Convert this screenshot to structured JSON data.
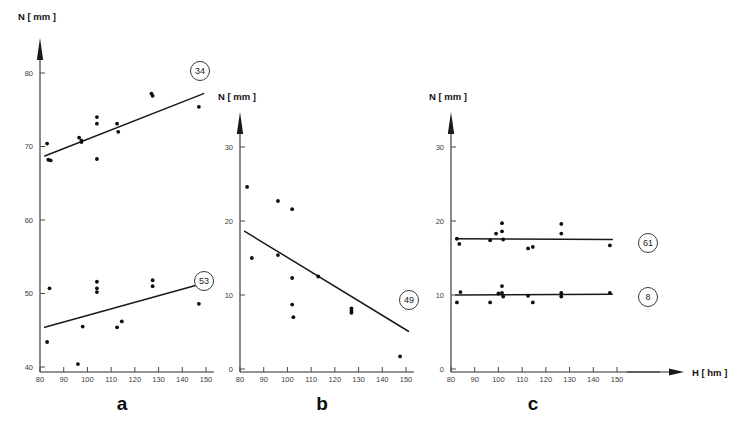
{
  "figure": {
    "panels": [
      {
        "letter": "a",
        "y_axis_title": "N [ mm ]",
        "x_axis_title": "",
        "y_ticks": [
          40,
          50,
          60,
          70,
          80
        ],
        "x_ticks": [
          80,
          90,
          100,
          110,
          120,
          130,
          140,
          150
        ],
        "badges": [
          "34",
          "53"
        ]
      },
      {
        "letter": "b",
        "y_axis_title": "N [ mm ]",
        "x_axis_title": "",
        "y_ticks": [
          0,
          10,
          20,
          30
        ],
        "x_ticks": [
          80,
          90,
          100,
          110,
          120,
          130,
          140,
          150
        ],
        "badges": [
          "49"
        ]
      },
      {
        "letter": "c",
        "y_axis_title": "N [ mm ]",
        "x_axis_title": "H [ hm ]",
        "y_ticks": [
          0,
          10,
          20,
          30
        ],
        "x_ticks": [
          80,
          90,
          100,
          110,
          120,
          130,
          140,
          150
        ],
        "badges": [
          "61",
          "8"
        ]
      }
    ]
  },
  "chart_data": [
    {
      "type": "scatter",
      "panel": "a",
      "title": "",
      "xlabel": "",
      "ylabel": "N [ mm ]",
      "xlim": [
        80,
        152
      ],
      "ylim": [
        39,
        83
      ],
      "grid": false,
      "legend": "none",
      "series": [
        {
          "name": "34",
          "badge": "34",
          "x": [
            83,
            83.5,
            84.5,
            96.5,
            97.5,
            97.5,
            104,
            104,
            104,
            112.5,
            113,
            127,
            127.5,
            147
          ],
          "y": [
            70.4,
            68.2,
            68.1,
            71.2,
            70.8,
            70.6,
            74.0,
            73.1,
            68.3,
            73.1,
            72.0,
            77.2,
            76.9,
            75.4
          ],
          "fit_line": {
            "x": [
              82,
              149
            ],
            "y": [
              68.7,
              77.2
            ]
          }
        },
        {
          "name": "53",
          "badge": "53",
          "x": [
            83,
            84,
            96,
            98,
            104,
            104,
            104,
            112.5,
            114.5,
            127.5,
            127.5,
            147
          ],
          "y": [
            43.4,
            50.7,
            40.4,
            45.5,
            51.6,
            50.7,
            50.2,
            45.4,
            46.2,
            51.8,
            51.0,
            48.6
          ],
          "fit_line": {
            "x": [
              82,
              149
            ],
            "y": [
              45.4,
              51.4
            ]
          }
        }
      ]
    },
    {
      "type": "scatter",
      "panel": "b",
      "title": "",
      "xlabel": "",
      "ylabel": "N [ mm ]",
      "xlim": [
        80,
        152
      ],
      "ylim": [
        0,
        33
      ],
      "grid": false,
      "legend": "none",
      "series": [
        {
          "name": "49",
          "badge": "49",
          "x": [
            83,
            85,
            96,
            96,
            102,
            102,
            102,
            102.5,
            113,
            127,
            127,
            127,
            147.5
          ],
          "y": [
            24.6,
            15.0,
            22.7,
            15.4,
            21.6,
            12.3,
            8.7,
            7.0,
            12.5,
            8.2,
            7.9,
            7.6,
            1.7
          ],
          "fit_line": {
            "x": [
              82,
              151
            ],
            "y": [
              18.6,
              5.1
            ]
          }
        }
      ]
    },
    {
      "type": "scatter",
      "panel": "c",
      "title": "",
      "xlabel": "H [ hm ]",
      "ylabel": "N [ mm ]",
      "xlim": [
        80,
        152
      ],
      "ylim": [
        0,
        33
      ],
      "grid": false,
      "legend": "none",
      "series": [
        {
          "name": "61",
          "badge": "61",
          "x": [
            82.5,
            83.5,
            96.5,
            99,
            101.5,
            101.5,
            102,
            112.5,
            114.5,
            126.5,
            126.5,
            147
          ],
          "y": [
            17.6,
            16.9,
            17.4,
            18.3,
            19.7,
            18.6,
            17.5,
            16.3,
            16.5,
            19.6,
            18.3,
            16.7
          ],
          "fit_line": {
            "x": [
              82,
              148
            ],
            "y": [
              17.6,
              17.5
            ]
          }
        },
        {
          "name": "8",
          "badge": "8",
          "x": [
            82.5,
            84,
            96.5,
            100,
            101.5,
            101.5,
            102,
            112.5,
            114.5,
            126.5,
            126.5,
            147
          ],
          "y": [
            9.0,
            10.4,
            9.0,
            10.2,
            11.2,
            10.3,
            9.8,
            9.9,
            9.0,
            10.3,
            9.8,
            10.3
          ],
          "fit_line": {
            "x": [
              82,
              148
            ],
            "y": [
              10.0,
              10.1
            ]
          }
        }
      ]
    }
  ]
}
